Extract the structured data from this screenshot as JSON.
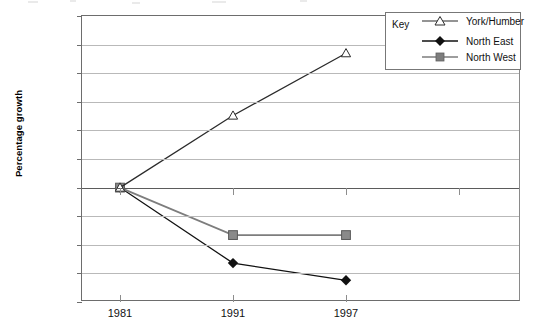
{
  "chart_data": {
    "type": "line",
    "title": "",
    "xlabel": "",
    "ylabel": "Percentage growth",
    "categories": [
      "1981",
      "1991",
      "1997"
    ],
    "x": [
      1981,
      1991,
      1997
    ],
    "ylim": [
      -2.0,
      3.0
    ],
    "yticks": [
      "3.0",
      "2.5",
      "2.0",
      "1.5",
      "1.0",
      "0.5",
      "0",
      "–0.5",
      "–1.0",
      "–1.5",
      "–2.0"
    ],
    "ytick_values": [
      3.0,
      2.5,
      2.0,
      1.5,
      1.0,
      0.5,
      0,
      -0.5,
      -1.0,
      -1.5,
      -2.0
    ],
    "grid": true,
    "legend_position": "top-right",
    "series": [
      {
        "name": "North East",
        "marker": "filled-diamond",
        "color": "#111111",
        "values": [
          0,
          -1.32,
          -1.62
        ]
      },
      {
        "name": "North West",
        "marker": "filled-square",
        "color": "#7d7d7d",
        "values": [
          0,
          -0.83,
          -0.83
        ]
      },
      {
        "name": "York/Humber",
        "marker": "open-triangle",
        "color": "#2b2b2b",
        "values": [
          0,
          1.26,
          2.35
        ]
      }
    ]
  },
  "axis": {
    "y_title": "Percentage growth"
  },
  "legend": {
    "title": "Key",
    "entries": [
      "North East",
      "North West",
      "York/Humber"
    ]
  }
}
